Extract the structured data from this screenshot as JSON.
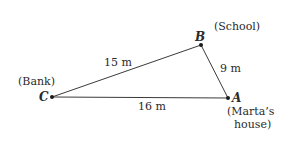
{
  "diagram": {
    "type": "triangle",
    "line_color": "#3a3a3a",
    "vertices": [
      {
        "id": "A",
        "label": "A",
        "place": "(Marta's house)",
        "place_lines": [
          "(Marta’s",
          "house)"
        ],
        "x": 228,
        "y": 98
      },
      {
        "id": "B",
        "label": "B",
        "place": "(School)",
        "x": 201,
        "y": 45
      },
      {
        "id": "C",
        "label": "C",
        "place": "(Bank)",
        "x": 52,
        "y": 97
      }
    ],
    "edges": [
      {
        "from": "C",
        "to": "B",
        "length_label": "15 m"
      },
      {
        "from": "B",
        "to": "A",
        "length_label": "9 m"
      },
      {
        "from": "C",
        "to": "A",
        "length_label": "16 m"
      }
    ]
  }
}
